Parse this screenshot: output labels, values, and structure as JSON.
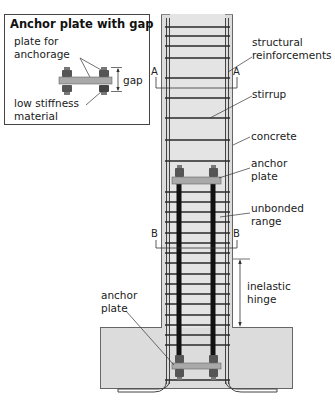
{
  "inset": {
    "title": "Anchor plate with gap",
    "labels": {
      "plate_line1": "plate for",
      "plate_line2": "anchorage",
      "gap": "gap",
      "material_line1": "low stiffness",
      "material_line2": "material"
    }
  },
  "callouts": {
    "structural_line1": "structural",
    "structural_line2": "reinforcements",
    "stirrup": "stirrup",
    "concrete": "concrete",
    "anchor_top_line1": "anchor",
    "anchor_top_line2": "plate",
    "unbonded_line1": "unbonded",
    "unbonded_line2": "range",
    "hinge_line1": "inelastic",
    "hinge_line2": "hinge",
    "anchor_bottom_line1": "anchor",
    "anchor_bottom_line2": "plate"
  },
  "sections": {
    "a_left": "A",
    "a_right": "A",
    "b_left": "B",
    "b_right": "B"
  },
  "colors": {
    "concrete": "#dcdcdc",
    "rebar": "#3a3a3a",
    "unbonded_bar": "#111111",
    "plate": "#a9a9a9",
    "outline": "#555555"
  }
}
